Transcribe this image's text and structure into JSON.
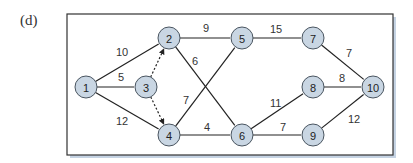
{
  "panel_label": "(d)",
  "colors": {
    "node_fill": "#c9d6e3",
    "node_stroke": "#4a5560",
    "edge": "#222222",
    "frame": "#333333",
    "shadow": "#c5d3e3"
  },
  "nodes": [
    {
      "id": "1",
      "label": "1",
      "x": 86,
      "y": 87
    },
    {
      "id": "2",
      "label": "2",
      "x": 169,
      "y": 38
    },
    {
      "id": "3",
      "label": "3",
      "x": 146,
      "y": 87
    },
    {
      "id": "4",
      "label": "4",
      "x": 169,
      "y": 135
    },
    {
      "id": "5",
      "label": "5",
      "x": 242,
      "y": 38
    },
    {
      "id": "6",
      "label": "6",
      "x": 242,
      "y": 135
    },
    {
      "id": "7",
      "label": "7",
      "x": 313,
      "y": 38
    },
    {
      "id": "8",
      "label": "8",
      "x": 313,
      "y": 87
    },
    {
      "id": "9",
      "label": "9",
      "x": 313,
      "y": 135
    },
    {
      "id": "10",
      "label": "10",
      "x": 373,
      "y": 87
    }
  ],
  "edges": [
    {
      "from": "1",
      "to": "2",
      "weight": "10",
      "lx": 116,
      "ly": 56,
      "dashed": false
    },
    {
      "from": "1",
      "to": "3",
      "weight": "5",
      "lx": 118,
      "ly": 81,
      "dashed": false
    },
    {
      "from": "1",
      "to": "4",
      "weight": "12",
      "lx": 116,
      "ly": 125,
      "dashed": false
    },
    {
      "from": "3",
      "to": "2",
      "weight": "",
      "dashed": true
    },
    {
      "from": "3",
      "to": "4",
      "weight": "",
      "dashed": true
    },
    {
      "from": "2",
      "to": "5",
      "weight": "9",
      "lx": 203,
      "ly": 32,
      "dashed": false
    },
    {
      "from": "2",
      "to": "6",
      "weight": "6",
      "lx": 192,
      "ly": 65,
      "dashed": false
    },
    {
      "from": "4",
      "to": "5",
      "weight": "7",
      "lx": 183,
      "ly": 104,
      "dashed": false
    },
    {
      "from": "4",
      "to": "6",
      "weight": "4",
      "lx": 204,
      "ly": 131,
      "dashed": false
    },
    {
      "from": "5",
      "to": "7",
      "weight": "15",
      "lx": 270,
      "ly": 33,
      "dashed": false
    },
    {
      "from": "7",
      "to": "10",
      "weight": "7",
      "lx": 346,
      "ly": 57,
      "dashed": false
    },
    {
      "from": "8",
      "to": "10",
      "weight": "8",
      "lx": 339,
      "ly": 82,
      "dashed": false
    },
    {
      "from": "6",
      "to": "8",
      "weight": "11",
      "lx": 270,
      "ly": 107,
      "dashed": false
    },
    {
      "from": "6",
      "to": "9",
      "weight": "7",
      "lx": 280,
      "ly": 131,
      "dashed": false
    },
    {
      "from": "9",
      "to": "10",
      "weight": "12",
      "lx": 348,
      "ly": 123,
      "dashed": false
    }
  ]
}
